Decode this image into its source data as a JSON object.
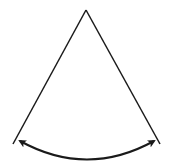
{
  "diagram": {
    "type": "sector-angle",
    "stroke_color": "#1a1a1a",
    "background": "#ffffff",
    "apex": [
      86,
      10
    ],
    "left_end": [
      13,
      144
    ],
    "right_end": [
      160,
      144
    ],
    "arc": {
      "start": [
        20,
        141
      ],
      "end": [
        154,
        141
      ],
      "control": [
        87,
        178
      ],
      "arrowheads": "both"
    }
  }
}
